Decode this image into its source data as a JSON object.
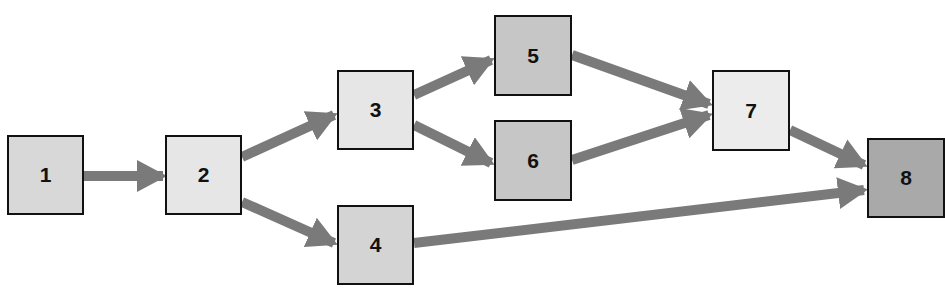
{
  "diagram": {
    "type": "flow-network",
    "arrow_color": "#7a7a7a",
    "nodes": [
      {
        "id": "1",
        "label": "1",
        "x": 7,
        "y": 135,
        "w": 77,
        "h": 80,
        "fill": "#d8d8d8"
      },
      {
        "id": "2",
        "label": "2",
        "x": 165,
        "y": 135,
        "w": 77,
        "h": 80,
        "fill": "#e6e6e6"
      },
      {
        "id": "3",
        "label": "3",
        "x": 337,
        "y": 70,
        "w": 77,
        "h": 80,
        "fill": "#e6e6e6"
      },
      {
        "id": "4",
        "label": "4",
        "x": 337,
        "y": 205,
        "w": 77,
        "h": 80,
        "fill": "#d4d4d4"
      },
      {
        "id": "5",
        "label": "5",
        "x": 494,
        "y": 15,
        "w": 78,
        "h": 81,
        "fill": "#c6c6c6"
      },
      {
        "id": "6",
        "label": "6",
        "x": 494,
        "y": 120,
        "w": 78,
        "h": 81,
        "fill": "#c6c6c6"
      },
      {
        "id": "7",
        "label": "7",
        "x": 712,
        "y": 70,
        "w": 78,
        "h": 81,
        "fill": "#ececec"
      },
      {
        "id": "8",
        "label": "8",
        "x": 867,
        "y": 138,
        "w": 78,
        "h": 80,
        "fill": "#a9a9a9"
      }
    ],
    "edges": [
      {
        "from": "1",
        "to": "2"
      },
      {
        "from": "2",
        "to": "3"
      },
      {
        "from": "2",
        "to": "4"
      },
      {
        "from": "3",
        "to": "5"
      },
      {
        "from": "3",
        "to": "6"
      },
      {
        "from": "5",
        "to": "7"
      },
      {
        "from": "6",
        "to": "7"
      },
      {
        "from": "7",
        "to": "8"
      },
      {
        "from": "4",
        "to": "8"
      }
    ]
  }
}
